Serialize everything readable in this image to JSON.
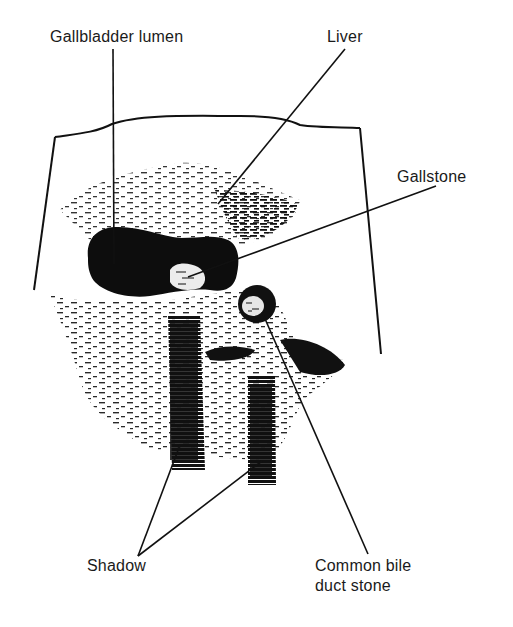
{
  "diagram": {
    "type": "annotated ultrasound illustration",
    "colors": {
      "ink": "#111111",
      "background": "#ffffff"
    },
    "labels": [
      {
        "id": "gallbladder-lumen",
        "text": "Gallbladder lumen"
      },
      {
        "id": "liver",
        "text": "Liver"
      },
      {
        "id": "gallstone",
        "text": "Gallstone"
      },
      {
        "id": "shadow",
        "text": "Shadow"
      },
      {
        "id": "cbd-stone-line1",
        "text": "Common bile"
      },
      {
        "id": "cbd-stone-line2",
        "text": "duct stone"
      }
    ],
    "structures": [
      "scan-frame",
      "liver-parenchyma",
      "gallbladder-lumen",
      "gallstone",
      "common-bile-duct-stone",
      "acoustic-shadows"
    ]
  }
}
